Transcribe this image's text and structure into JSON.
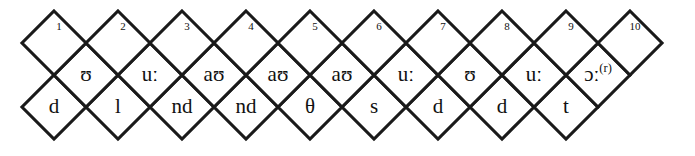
{
  "diagram": {
    "geometry": {
      "half_width": 32,
      "half_height": 32,
      "origin_x": 22,
      "top_apex_y": 11,
      "stroke_color": "#1a1a1a",
      "fill_color": "#ffffff"
    },
    "rows": {
      "index_row": {
        "name": "numbered-diamonds",
        "cells": [
          {
            "label": "1"
          },
          {
            "label": "2"
          },
          {
            "label": "3"
          },
          {
            "label": "4"
          },
          {
            "label": "5"
          },
          {
            "label": "6"
          },
          {
            "label": "7"
          },
          {
            "label": "8"
          },
          {
            "label": "9"
          },
          {
            "label": "10"
          }
        ]
      },
      "vowel_row": {
        "name": "vowel-diamonds",
        "cells": [
          {
            "label": "ʊ"
          },
          {
            "label": "uː"
          },
          {
            "label": "aʊ"
          },
          {
            "label": "aʊ"
          },
          {
            "label": "aʊ"
          },
          {
            "label": "uː"
          },
          {
            "label": "ʊ"
          },
          {
            "label": "uː"
          },
          {
            "label": "ɔː",
            "superscript": "(r)"
          }
        ]
      },
      "consonant_row": {
        "name": "consonant-diamonds",
        "cells": [
          {
            "label": "d"
          },
          {
            "label": "l"
          },
          {
            "label": "nd"
          },
          {
            "label": "nd"
          },
          {
            "label": "θ"
          },
          {
            "label": "s"
          },
          {
            "label": "d"
          },
          {
            "label": "d"
          },
          {
            "label": "t"
          }
        ]
      }
    }
  }
}
